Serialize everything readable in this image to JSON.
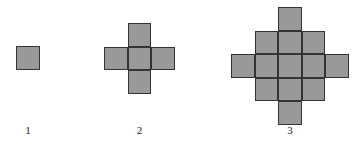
{
  "figure": {
    "title": "",
    "background_color": "#ffffff",
    "cell_fill_color": "#999999",
    "cell_border_color": "#333333",
    "label_color": "#1a1a1a",
    "items": [
      {
        "label": "1",
        "square_count": 1,
        "rows": [
          1
        ],
        "grid_size": 1,
        "cell_size": 24,
        "origin_x": 16,
        "origin_y": 46,
        "label_x": 16,
        "label_y": 124,
        "label_width": 24
      },
      {
        "label": "2",
        "square_count": 5,
        "rows": [
          1,
          3,
          1
        ],
        "grid_size": 3,
        "cell_size": 23.5,
        "origin_x": 104,
        "origin_y": 23,
        "label_x": 104,
        "label_y": 124,
        "label_width": 71
      },
      {
        "label": "3",
        "square_count": 13,
        "rows": [
          1,
          3,
          5,
          3,
          1
        ],
        "grid_size": 5,
        "cell_size": 23.5,
        "origin_x": 231,
        "origin_y": 7,
        "label_x": 231,
        "label_y": 124,
        "label_width": 118
      }
    ]
  }
}
